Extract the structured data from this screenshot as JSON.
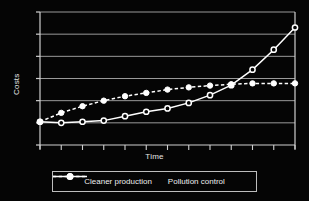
{
  "chart_data": {
    "type": "line",
    "title": "",
    "xlabel": "Time",
    "ylabel": "Costs",
    "grid": true,
    "legend_position": "bottom",
    "xlim": [
      0,
      12
    ],
    "ylim": [
      0,
      6
    ],
    "x_tick_labels": [],
    "y_tick_labels": [],
    "x_tick_count": 13,
    "y_tick_count": 7,
    "gridline_count": 6,
    "x": [
      0,
      1,
      2,
      3,
      4,
      5,
      6,
      7,
      8,
      9,
      10,
      11,
      12
    ],
    "series": [
      {
        "name": "Cleaner production",
        "marker": "open-circle",
        "line_style": "solid",
        "legend_line_style": "dashed",
        "color": "#ffffff",
        "values": [
          1.05,
          1.0,
          1.05,
          1.1,
          1.3,
          1.5,
          1.65,
          1.9,
          2.25,
          2.7,
          3.4,
          4.3,
          5.3
        ]
      },
      {
        "name": "Pollution control",
        "marker": "filled-circle",
        "line_style": "dashed",
        "legend_line_style": "solid",
        "color": "#ffffff",
        "values": [
          1.05,
          1.45,
          1.75,
          2.0,
          2.2,
          2.35,
          2.5,
          2.6,
          2.68,
          2.74,
          2.78,
          2.78,
          2.78
        ]
      }
    ]
  },
  "legend": {
    "entries": [
      {
        "label": "Cleaner production",
        "swatch": "dashed-open-circle-marker"
      },
      {
        "label": "Pollution control",
        "swatch": "solid-filled-circle-marker"
      }
    ]
  },
  "colors": {
    "background": "#050505",
    "axis": "#cfcfcf",
    "grid": "#9a9a9a",
    "text": "#ededed",
    "series": "#ffffff"
  }
}
